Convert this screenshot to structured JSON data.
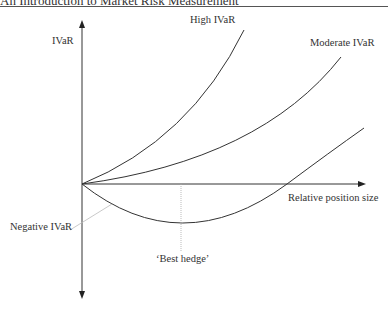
{
  "header": {
    "running_title": "An Introduction to Market Risk Measurement"
  },
  "diagram": {
    "y_axis_label": "IVaR",
    "x_axis_label": "Relative position size",
    "curves": [
      {
        "label": "High IVaR"
      },
      {
        "label": "Moderate IVaR"
      },
      {
        "label": "Negative IVaR"
      }
    ],
    "annotation": "‘Best hedge’"
  }
}
